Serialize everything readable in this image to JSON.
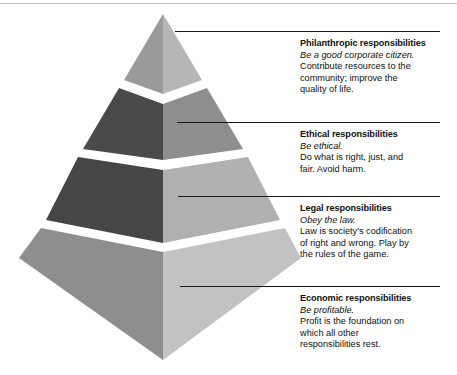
{
  "figure": {
    "name": "carrolls-pyramid-of-corporate-social-responsibility",
    "background_color": "#ffffff",
    "top_rule_color": "#c9c9c9",
    "leader_line_color": "#1a1a1a",
    "text_color": "#111111"
  },
  "pyramid": {
    "apex": {
      "x": 163,
      "y": 14
    },
    "base_left": {
      "x": 19,
      "y": 258
    },
    "base_right": {
      "x": 301,
      "y": 258
    },
    "base_front": {
      "x": 163,
      "y": 360
    },
    "center_edge_x": 163,
    "gap_color": "#ffffff",
    "tiers": [
      {
        "id": "philanthropic",
        "level": 4,
        "position": "top",
        "left_face_color": "#9a9a9a",
        "right_face_color": "#b6b6b6"
      },
      {
        "id": "ethical",
        "level": 3,
        "position": "upper-middle",
        "left_face_color": "#4a4a4a",
        "right_face_color": "#8e8e8e"
      },
      {
        "id": "legal",
        "level": 2,
        "position": "lower-middle",
        "left_face_color": "#464646",
        "right_face_color": "#b0b0b0"
      },
      {
        "id": "economic",
        "level": 1,
        "position": "base",
        "left_face_color": "#8e8e8e",
        "right_face_color": "#c2c2c2"
      }
    ]
  },
  "callouts": [
    {
      "id": "philanthropic",
      "title": "Philanthropic responsibilities",
      "motto": "Be a good corporate citizen.",
      "body": "Contribute resources to the community; improve the quality of life.",
      "body_lines": [
        "Contribute resources to the",
        "community; improve the",
        "quality of life."
      ],
      "leader_line": {
        "x1": 175,
        "x2": 440,
        "y": 31
      }
    },
    {
      "id": "ethical",
      "title": "Ethical responsibilities",
      "motto": "Be ethical.",
      "body": "Do what is right, just, and fair. Avoid harm.",
      "body_lines": [
        "Do what is right, just, and",
        "fair. Avoid harm."
      ],
      "leader_line": {
        "x1": 177,
        "x2": 440,
        "y": 122
      }
    },
    {
      "id": "legal",
      "title": "Legal responsibilities",
      "motto": "Obey the law.",
      "body": "Law is society's codification of right and wrong. Play by the rules of the game.",
      "body_lines": [
        "Law is society's codification",
        "of right and wrong. Play by",
        "the rules of the game."
      ],
      "leader_line": {
        "x1": 178,
        "x2": 440,
        "y": 196
      }
    },
    {
      "id": "economic",
      "title": "Economic responsibilities",
      "motto": "Be profitable.",
      "body": "Profit is the foundation on which all other responsibilities rest.",
      "body_lines": [
        "Profit is the foundation on",
        "which all other",
        "responsibilities rest."
      ],
      "leader_line": {
        "x1": 180,
        "x2": 440,
        "y": 286
      }
    }
  ]
}
